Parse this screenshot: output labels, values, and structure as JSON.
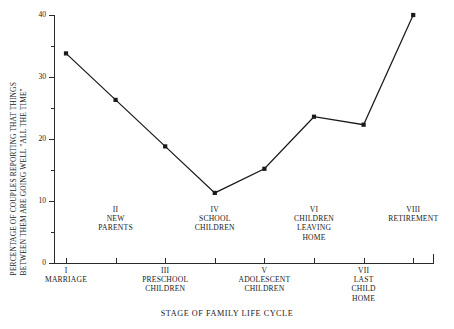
{
  "chart_data": {
    "type": "line",
    "title": "",
    "xlabel": "STAGE OF FAMILY LIFE CYCLE",
    "ylabel": "PERCENTAGE OF COUPLES REPORTING THAT THINGS BETWEEN THEM ARE GOING WELL \"ALL THE TIME\"",
    "ylabel_line1": "PERCENTAGE OF COUPLES REPORTING THAT THINGS",
    "ylabel_line2": "BETWEEN THEM ARE GOING WELL \"ALL THE TIME\"",
    "ylim": [
      0,
      40
    ],
    "yticks": [
      0,
      10,
      20,
      30,
      40
    ],
    "ytick_labels": [
      "0",
      "10",
      "20",
      "30",
      "40"
    ],
    "yminor_ticks": [
      5,
      15,
      25,
      35
    ],
    "grid": false,
    "legend": false,
    "categories": [
      "I MARRIAGE",
      "II NEW PARENTS",
      "III PRESCHOOL CHILDREN",
      "IV SCHOOL CHILDREN",
      "V ADOLESCENT CHILDREN",
      "VI CHILDREN LEAVING HOME",
      "VII LAST CHILD HOME",
      "VIII RETIREMENT"
    ],
    "values": [
      33.8,
      26.3,
      18.8,
      11.3,
      15.2,
      23.6,
      22.3,
      40.0
    ],
    "marker": "filled-square",
    "line_color": "#1a1a1a",
    "marker_color": "#1a1a1a"
  },
  "xaxis": {
    "title": "STAGE OF FAMILY LIFE CYCLE",
    "stages": [
      {
        "numeral": "I",
        "name": "MARRIAGE",
        "row": "lower"
      },
      {
        "numeral": "II",
        "name": "NEW\nPARENTS",
        "row": "upper"
      },
      {
        "numeral": "III",
        "name": "PRESCHOOL\nCHILDREN",
        "row": "lower"
      },
      {
        "numeral": "IV",
        "name": "SCHOOL\nCHILDREN",
        "row": "upper"
      },
      {
        "numeral": "V",
        "name": "ADOLESCENT\nCHILDREN",
        "row": "lower"
      },
      {
        "numeral": "VI",
        "name": "CHILDREN\nLEAVING\nHOME",
        "row": "upper"
      },
      {
        "numeral": "VII",
        "name": "LAST\nCHILD\nHOME",
        "row": "lower"
      },
      {
        "numeral": "VIII",
        "name": "RETIREMENT",
        "row": "upper"
      }
    ],
    "labels_upper": [
      "II\nNEW\nPARENTS",
      "IV\nSCHOOL\nCHILDREN",
      "VI\nCHILDREN\nLEAVING\nHOME",
      "VIII\nRETIREMENT"
    ],
    "labels_lower": [
      "I\nMARRIAGE",
      "III\nPRESCHOOL\nCHILDREN",
      "V\nADOLESCENT\nCHILDREN",
      "VII\nLAST\nCHILD\nHOME"
    ]
  },
  "colors": {
    "ink": "#1a1a1a",
    "axis": "#2a2a2a",
    "background": "#ffffff"
  }
}
